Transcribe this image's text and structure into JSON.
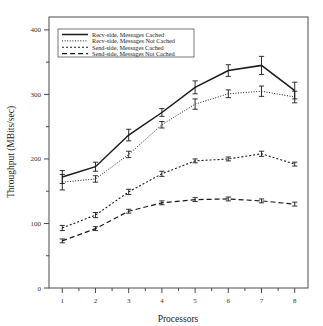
{
  "chart_data": {
    "type": "line",
    "title": "",
    "xlabel": "Processors",
    "ylabel": "Throughput (MBits/sec)",
    "x": [
      1,
      2,
      3,
      4,
      5,
      6,
      7,
      8
    ],
    "xlim": [
      0.6,
      8.4
    ],
    "ylim": [
      0,
      420
    ],
    "xticks": [
      1,
      2,
      3,
      4,
      5,
      6,
      7,
      8
    ],
    "yticks": [
      0,
      100,
      200,
      300,
      400
    ],
    "xticklabels": [
      "1",
      "2",
      "3",
      "4",
      "5",
      "6",
      "7",
      "8"
    ],
    "yticklabels": [
      "0",
      "100",
      "200",
      "300",
      "400"
    ],
    "grid": false,
    "legend_position": "upper left",
    "series": [
      {
        "name": "Recv-side, Messages Cached",
        "style": "solid",
        "values": [
          172,
          188,
          237,
          272,
          311,
          337,
          345,
          306
        ],
        "errors": [
          10,
          7,
          9,
          6,
          10,
          9,
          14,
          13
        ]
      },
      {
        "name": "Recv-side, Messages Not Cached",
        "style": "dotted",
        "values": [
          164,
          169,
          207,
          253,
          285,
          301,
          305,
          296
        ],
        "errors": [
          12,
          5,
          5,
          5,
          8,
          6,
          8,
          9
        ]
      },
      {
        "name": "Send-side, Messages Cached",
        "style": "densely-dotted",
        "values": [
          93,
          113,
          149,
          177,
          197,
          200,
          208,
          192
        ],
        "errors": [
          4,
          4,
          4,
          4,
          3,
          3,
          4,
          3
        ]
      },
      {
        "name": "Send-side, Messages Not Cached",
        "style": "dashed",
        "values": [
          73,
          92,
          119,
          132,
          137,
          138,
          135,
          130
        ],
        "errors": [
          3,
          3,
          3,
          3,
          3,
          3,
          3,
          3
        ]
      }
    ]
  },
  "legend": {
    "entries": [
      "Recv-side, Messages Cached",
      "Recv-side, Messages Not Cached",
      "Send-side, Messages Cached",
      "Send-side, Messages Not Cached"
    ]
  },
  "colors": {
    "line": "#1a1a1a",
    "axis": "#4a4a4a",
    "background": "#ffffff"
  }
}
